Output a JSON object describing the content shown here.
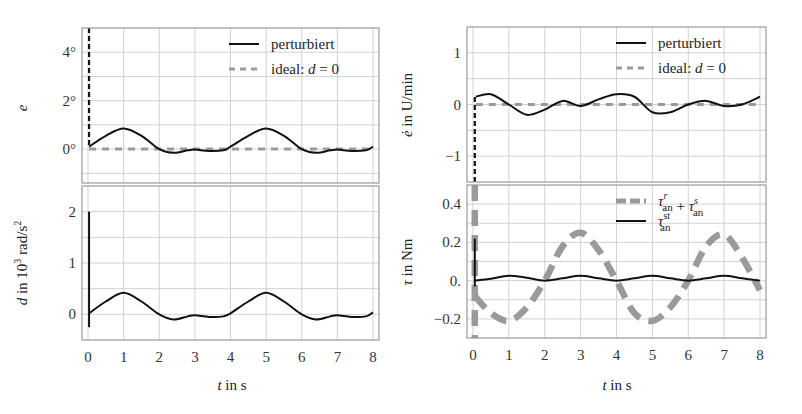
{
  "chart_data": [
    {
      "id": "e",
      "type": "line",
      "panel": "top-left",
      "ylabel": "e",
      "xlabel": "",
      "xlim": [
        0,
        8
      ],
      "ylim": [
        -1.4,
        5.0
      ],
      "yticks": [
        0,
        2,
        4
      ],
      "ytick_labels": [
        "0°",
        "2°",
        "4°"
      ],
      "ygrid_step": 1,
      "xticks": [
        0,
        1,
        2,
        3,
        4,
        5,
        6,
        7,
        8
      ],
      "legend": [
        {
          "label": "perturbiert",
          "style": "solid",
          "color": "#111111"
        },
        {
          "label": "ideal: d = 0",
          "style": "dashed",
          "color": "#9a9a9a"
        }
      ],
      "series": [
        {
          "name": "perturbiert",
          "style": "solid",
          "color": "#111111",
          "x": [
            0.03,
            0.5,
            1.0,
            1.5,
            2.0,
            2.4,
            2.8,
            3.0,
            3.4,
            3.8,
            4.0,
            4.5,
            5.0,
            5.5,
            6.0,
            6.4,
            6.8,
            7.0,
            7.4,
            7.8,
            8.0
          ],
          "y": [
            0.1,
            0.55,
            0.85,
            0.55,
            0.0,
            -0.15,
            -0.05,
            -0.02,
            -0.08,
            -0.05,
            0.1,
            0.55,
            0.85,
            0.55,
            0.0,
            -0.15,
            -0.05,
            -0.02,
            -0.08,
            -0.05,
            0.1
          ]
        },
        {
          "name": "ideal: d = 0",
          "style": "dashed",
          "color": "#9a9a9a",
          "x": [
            0.03,
            8.0
          ],
          "y": [
            0.0,
            0.0
          ]
        },
        {
          "name": "initial-spike",
          "style": "dashed-black",
          "color": "#111111",
          "x": [
            0.03,
            0.03
          ],
          "y": [
            5.0,
            0.1
          ]
        }
      ]
    },
    {
      "id": "d",
      "type": "line",
      "panel": "bottom-left",
      "ylabel": "d in 10³ rad/s²",
      "xlabel": "t in s",
      "xlim": [
        0,
        8
      ],
      "ylim": [
        -0.5,
        2.5
      ],
      "yticks": [
        0,
        1,
        2
      ],
      "ytick_labels": [
        "0",
        "1",
        "2"
      ],
      "ygrid_step": 0.5,
      "xticks": [
        0,
        1,
        2,
        3,
        4,
        5,
        6,
        7,
        8
      ],
      "xtick_labels": [
        "0",
        "1",
        "2",
        "3",
        "4",
        "5",
        "6",
        "7",
        "8"
      ],
      "series": [
        {
          "name": "perturbiert",
          "style": "solid",
          "color": "#111111",
          "x": [
            0.03,
            0.5,
            1.0,
            1.5,
            2.0,
            2.4,
            2.8,
            3.0,
            3.4,
            3.8,
            4.0,
            4.5,
            5.0,
            5.5,
            6.0,
            6.4,
            6.8,
            7.0,
            7.4,
            7.8,
            8.0
          ],
          "y": [
            0.02,
            0.25,
            0.42,
            0.25,
            0.0,
            -0.1,
            -0.04,
            -0.02,
            -0.05,
            -0.04,
            0.02,
            0.25,
            0.42,
            0.25,
            0.0,
            -0.1,
            -0.04,
            -0.02,
            -0.05,
            -0.04,
            0.04
          ]
        },
        {
          "name": "initial-spike",
          "style": "solid",
          "color": "#111111",
          "x": [
            0.03,
            0.03
          ],
          "y": [
            2.0,
            -0.25
          ]
        }
      ]
    },
    {
      "id": "edot",
      "type": "line",
      "panel": "top-right",
      "ylabel": "ė in U/min",
      "xlabel": "",
      "xlim": [
        0,
        8
      ],
      "ylim": [
        -1.5,
        1.5
      ],
      "yticks": [
        -1,
        0,
        1
      ],
      "ytick_labels": [
        "−1",
        "0",
        "1"
      ],
      "ygrid_step": 0.5,
      "xticks": [
        0,
        1,
        2,
        3,
        4,
        5,
        6,
        7,
        8
      ],
      "legend": [
        {
          "label": "perturbiert",
          "style": "solid",
          "color": "#111111"
        },
        {
          "label": "ideal: d = 0",
          "style": "dashed",
          "color": "#9a9a9a"
        }
      ],
      "series": [
        {
          "name": "perturbiert",
          "style": "solid",
          "color": "#111111",
          "x": [
            0.08,
            0.5,
            1.0,
            1.5,
            2.0,
            2.5,
            3.0,
            3.5,
            4.0,
            4.5,
            5.0,
            5.5,
            6.0,
            6.5,
            7.0,
            7.5,
            8.0
          ],
          "y": [
            0.15,
            0.2,
            0.0,
            -0.2,
            -0.1,
            0.07,
            -0.03,
            0.1,
            0.2,
            0.15,
            -0.15,
            -0.15,
            0.0,
            0.07,
            -0.03,
            0.0,
            0.15
          ]
        },
        {
          "name": "ideal: d = 0",
          "style": "dashed",
          "color": "#9a9a9a",
          "x": [
            0.08,
            8.0
          ],
          "y": [
            0.0,
            0.0
          ]
        },
        {
          "name": "initial-spike",
          "style": "dashed-black",
          "color": "#111111",
          "x": [
            0.05,
            0.05
          ],
          "y": [
            -1.5,
            0.15
          ]
        }
      ]
    },
    {
      "id": "tau",
      "type": "line",
      "panel": "bottom-right",
      "ylabel": "τ in Nm",
      "xlabel": "t in s",
      "xlim": [
        0,
        8
      ],
      "ylim": [
        -0.3,
        0.5
      ],
      "yticks": [
        -0.2,
        0.0,
        0.2,
        0.4
      ],
      "ytick_labels": [
        "−0.2",
        "0.",
        "0.2",
        "0.4"
      ],
      "ygrid_step": 0.1,
      "xticks": [
        0,
        1,
        2,
        3,
        4,
        5,
        6,
        7,
        8
      ],
      "xtick_labels": [
        "0",
        "1",
        "2",
        "3",
        "4",
        "5",
        "6",
        "7",
        "8"
      ],
      "legend": [
        {
          "label": "τ^r_an + τ^s_an",
          "style": "thick-dashed",
          "color": "#9a9a9a"
        },
        {
          "label": "τ^st_an",
          "style": "solid",
          "color": "#111111"
        }
      ],
      "series": [
        {
          "name": "τ^r_an + τ^s_an",
          "style": "thick-dashed",
          "color": "#9a9a9a",
          "x": [
            0.05,
            0.5,
            1.0,
            1.5,
            2.0,
            2.5,
            3.0,
            3.5,
            4.0,
            4.5,
            5.0,
            5.5,
            6.0,
            6.5,
            7.0,
            7.5,
            8.0
          ],
          "y": [
            -0.08,
            -0.17,
            -0.21,
            -0.14,
            0.0,
            0.18,
            0.25,
            0.16,
            0.0,
            -0.17,
            -0.21,
            -0.14,
            0.0,
            0.18,
            0.24,
            0.12,
            -0.05
          ]
        },
        {
          "name": "τ^st_an",
          "style": "solid",
          "color": "#111111",
          "x": [
            0.05,
            0.5,
            1.0,
            1.5,
            2.0,
            2.5,
            3.0,
            3.5,
            4.0,
            4.5,
            5.0,
            5.5,
            6.0,
            6.5,
            7.0,
            7.5,
            8.0
          ],
          "y": [
            0.0,
            0.01,
            0.025,
            0.015,
            0.0,
            0.012,
            0.025,
            0.012,
            0.0,
            0.012,
            0.025,
            0.012,
            0.0,
            0.012,
            0.025,
            0.012,
            0.0
          ]
        },
        {
          "name": "initial-spike-gray",
          "style": "thick-dashed",
          "color": "#9a9a9a",
          "x": [
            0.05,
            0.05
          ],
          "y": [
            0.5,
            -0.3
          ]
        },
        {
          "name": "initial-spike-black",
          "style": "solid",
          "color": "#111111",
          "x": [
            0.05,
            0.05
          ],
          "y": [
            0.22,
            -0.03
          ]
        }
      ]
    }
  ],
  "labels": {
    "e_ylabel": "e",
    "d_ylabel": "d in 10³ rad/s²",
    "edot_ylabel": "ė in U/min",
    "tau_ylabel": "τ in Nm",
    "xlabel_left": "t in s",
    "xlabel_right": "t in s",
    "legend_perturbiert": "perturbiert",
    "legend_ideal": "ideal: d = 0"
  }
}
